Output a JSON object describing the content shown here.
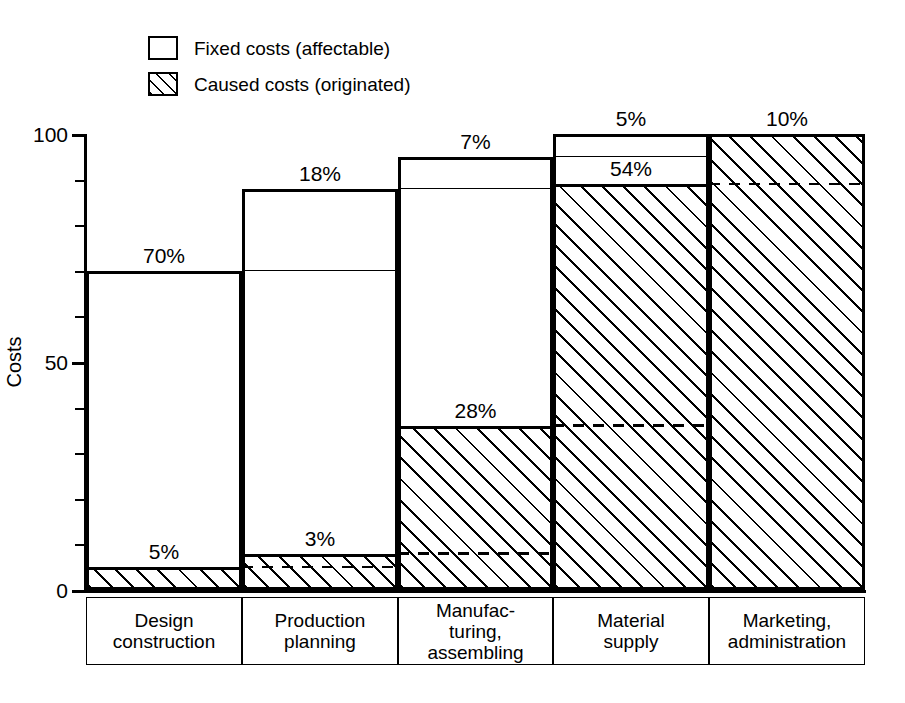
{
  "legend": {
    "items": [
      {
        "key": "fixed",
        "label": "Fixed costs (affectable)",
        "pattern": "solid-outline"
      },
      {
        "key": "caused",
        "label": "Caused costs (originated)",
        "pattern": "diagonal-hatch"
      }
    ]
  },
  "axes": {
    "y_title": "Costs",
    "y_ticks_labeled": [
      "0",
      "50",
      "100"
    ],
    "y_min": 0,
    "y_max": 100,
    "y_tick_step": 10
  },
  "chart_data": {
    "type": "bar",
    "title": "",
    "xlabel": "",
    "ylabel": "Costs",
    "ylim": [
      0,
      100
    ],
    "grid": false,
    "legend_position": "top-left",
    "categories": [
      "Design construction",
      "Production planning",
      "Manufac- turing, assembling",
      "Material supply",
      "Marketing, administration"
    ],
    "series": [
      {
        "name": "Fixed costs (affectable)",
        "values": [
          70,
          88,
          95,
          100,
          100
        ],
        "note": "cumulative top of each bar"
      },
      {
        "name": "Caused costs (originated)",
        "values": [
          5,
          8,
          36,
          89,
          100
        ],
        "note": "cumulative top of hatched portion"
      }
    ],
    "increments": {
      "fixed_percent": [
        70,
        18,
        7,
        5,
        10
      ],
      "caused_percent": [
        5,
        3,
        28,
        54,
        10
      ]
    },
    "bars": [
      {
        "category": "Design construction",
        "total_top": 70,
        "caused_top": 5,
        "prev_total": 0,
        "prev_caused": 0,
        "fixed_label": "70%",
        "caused_label": "5%",
        "fixed_label_pos": "above-total",
        "caused_label_pos": "above-caused",
        "show_prev_total_line": false,
        "show_prev_caused_dash": false
      },
      {
        "category": "Production planning",
        "total_top": 88,
        "caused_top": 8,
        "prev_total": 70,
        "prev_caused": 5,
        "fixed_label": "18%",
        "caused_label": "3%",
        "fixed_label_pos": "above-total",
        "caused_label_pos": "above-caused",
        "show_prev_total_line": true,
        "show_prev_caused_dash": true
      },
      {
        "category": "Manufac- turing, assembling",
        "total_top": 95,
        "caused_top": 36,
        "prev_total": 88,
        "prev_caused": 8,
        "fixed_label": "7%",
        "caused_label": "28%",
        "fixed_label_pos": "above-total",
        "caused_label_pos": "above-caused",
        "show_prev_total_line": true,
        "show_prev_caused_dash": true
      },
      {
        "category": "Material supply",
        "total_top": 100,
        "caused_top": 89,
        "prev_total": 95,
        "prev_caused": 36,
        "fixed_label": "5%",
        "caused_label": "54%",
        "fixed_label_pos": "above-total",
        "caused_label_pos": "above-caused",
        "show_prev_total_line": true,
        "show_prev_caused_dash": true
      },
      {
        "category": "Marketing, administration",
        "total_top": 100,
        "caused_top": 100,
        "prev_total": 100,
        "prev_caused": 89,
        "fixed_label": "10%",
        "caused_label": "",
        "fixed_label_pos": "above-total",
        "caused_label_pos": "none",
        "show_prev_total_line": false,
        "show_prev_caused_dash": true
      }
    ]
  },
  "category_cells": [
    {
      "line1": "Design",
      "line2": "construction",
      "line3": ""
    },
    {
      "line1": "Production",
      "line2": "planning",
      "line3": ""
    },
    {
      "line1": "Manufac-",
      "line2": "turing,",
      "line3": "assembling"
    },
    {
      "line1": "Material",
      "line2": "supply",
      "line3": ""
    },
    {
      "line1": "Marketing,",
      "line2": "administration",
      "line3": ""
    }
  ],
  "colors": {
    "ink": "#000000",
    "background": "#ffffff"
  }
}
